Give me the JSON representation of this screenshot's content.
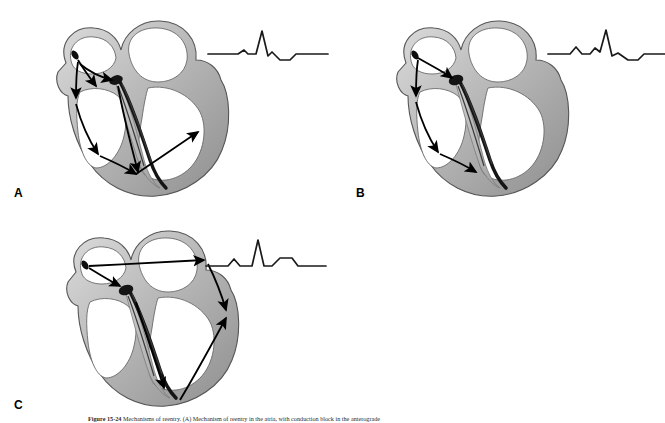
{
  "figure": {
    "label": "Figure 15-24",
    "caption_text": "Mechanisms of reentry. (A) Mechanism of reentry in the atria, with conduction block in the anterograde",
    "background_color": "#ffffff",
    "line_color": "#000000",
    "wall_fill_light": "#d8d8d8",
    "wall_fill_mid": "#b4b4b4",
    "wall_fill_dark": "#8c8c8c",
    "chamber_fill": "#ffffff",
    "conduction_color": "#151515"
  },
  "panels": [
    {
      "id": "A",
      "label": "A",
      "name": "panel-a",
      "heart_name": "heart-cross-section-a",
      "ecg_name": "ecg-tracing-a",
      "description": "Heart cross-section with multiple conduction arrows spreading through both atria and both ventricles",
      "arrow_count": 7,
      "ecg": {
        "p_wave": "small",
        "qrs": "tall-narrow",
        "t_wave": "inverted-then-positive",
        "path": "M0,28 L30,28 L36,24 L40,28 L48,28 L54,5 L60,30 L64,26 L72,34 L82,34 L88,28 L120,28"
      }
    },
    {
      "id": "B",
      "label": "B",
      "name": "panel-b",
      "heart_name": "heart-cross-section-b",
      "ecg_name": "ecg-tracing-b",
      "description": "Heart cross-section with arrows limited to the right atrium and right ventricle",
      "arrow_count": 4,
      "ecg": {
        "p_wave": "rounded",
        "qrs": "tall-narrow",
        "t_wave": "inverted-then-positive",
        "path": "M0,28 L22,28 L28,21 L34,28 L42,28 L47,22 L52,26 L58,4 L64,30 L70,27 L80,34 L90,34 L96,28 L120,28"
      }
    },
    {
      "id": "C",
      "label": "C",
      "name": "panel-c",
      "heart_name": "heart-cross-section-c",
      "ecg_name": "ecg-tracing-c",
      "description": "Heart cross-section with arrows crossing to the left atrium and down into the left ventricle",
      "arrow_count": 5,
      "ecg": {
        "p_wave": "rounded",
        "qrs": "tall-narrow-spike",
        "t_wave": "broad-positive",
        "path": "M0,30 L22,30 L28,23 L34,30 L46,30 L52,4 L58,30 L66,30 L74,22 L86,22 L92,30 L120,30"
      }
    }
  ],
  "anatomy": {
    "right_atrium": "right-atrium",
    "left_atrium": "left-atrium",
    "right_ventricle": "right-ventricle",
    "left_ventricle": "left-ventricle",
    "sa_node": "sa-node",
    "av_node": "av-node",
    "bundle_of_his": "bundle-of-his",
    "septum": "interventricular-septum"
  }
}
